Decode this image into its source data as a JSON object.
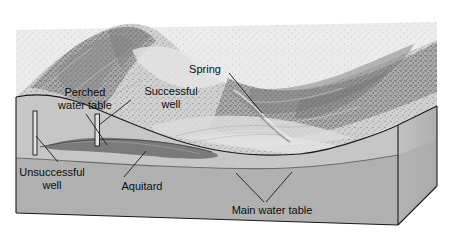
{
  "figure": {
    "type": "block-diagram",
    "background_color": "#ffffff",
    "style": "grayscale pen-and-ink shaded relief"
  },
  "colors": {
    "line": "#1a1a1a",
    "block_front_upper": "#c9c9c9",
    "block_front_lower": "#b0b0b0",
    "block_side": "#bdbdbd",
    "aquitard": "#7d7d7d",
    "terrain_light": "#e3e3e3",
    "terrain_mid": "#b8b8b8",
    "terrain_dark": "#8f8f8f",
    "well_fill": "#dcdcdc",
    "text": "#0d0d0d"
  },
  "labels": [
    {
      "id": "perched-water-table",
      "text": "Perched\nwater table",
      "x": 48,
      "y": 86,
      "width": 74,
      "leader": true
    },
    {
      "id": "successful-well",
      "text": "Successful\nwell",
      "x": 135,
      "y": 85,
      "width": 72,
      "leader": true
    },
    {
      "id": "spring",
      "text": "Spring",
      "x": 182,
      "y": 63,
      "width": 46,
      "leader": true
    },
    {
      "id": "unsuccessful-well",
      "text": "Unsuccessful\nwell",
      "x": 10,
      "y": 166,
      "width": 84,
      "leader": true
    },
    {
      "id": "aquitard",
      "text": "Aquitard",
      "x": 114,
      "y": 180,
      "width": 56,
      "leader": true
    },
    {
      "id": "main-water-table",
      "text": "Main water table",
      "x": 222,
      "y": 204,
      "width": 100,
      "leader": true
    }
  ],
  "features": {
    "unsuccessful_well_label": "Unsuccessful well",
    "successful_well_label": "Successful well",
    "spring_label": "Spring",
    "aquitard_label": "Aquitard",
    "perched_water_table_label": "Perched water table",
    "main_water_table_label": "Main water table"
  }
}
